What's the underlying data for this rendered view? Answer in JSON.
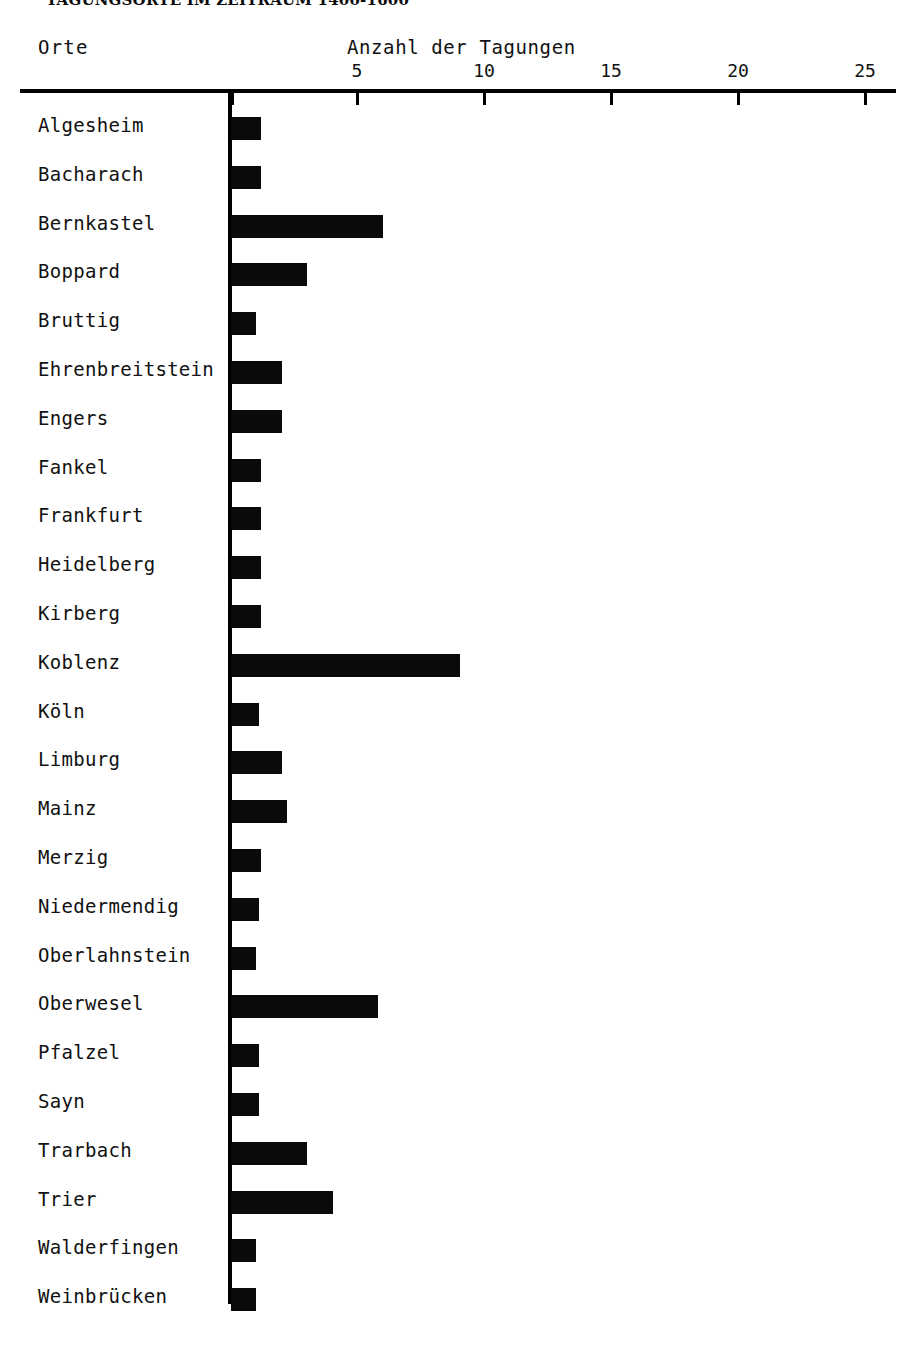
{
  "document": {
    "title_cropped": "TAGUNGSORTE IM ZEITRAUM 1400-1600"
  },
  "headers": {
    "category_axis_title": "Orte",
    "value_axis_title": "Anzahl der Tagungen"
  },
  "chart_data": {
    "type": "bar",
    "orientation": "horizontal",
    "title": "Anzahl der Tagungen",
    "xlabel": "Anzahl der Tagungen",
    "ylabel": "Orte",
    "xlim": [
      0,
      26
    ],
    "grid": false,
    "legend": null,
    "tick_labels": [
      "5",
      "10",
      "15",
      "20",
      "25"
    ],
    "tick_values": [
      5,
      10,
      15,
      20,
      25
    ],
    "categories": [
      "Algesheim",
      "Bacharach",
      "Bernkastel",
      "Boppard",
      "Bruttig",
      "Ehrenbreitstein",
      "Engers",
      "Fankel",
      "Frankfurt",
      "Heidelberg",
      "Kirberg",
      "Koblenz",
      "Köln",
      "Limburg",
      "Mainz",
      "Merzig",
      "Niedermendig",
      "Oberlahnstein",
      "Oberwesel",
      "Pfalzel",
      "Sayn",
      "Trarbach",
      "Trier",
      "Walderfingen",
      "Weinbrücken"
    ],
    "values": [
      1.2,
      1.2,
      6.0,
      3.0,
      1.0,
      2.0,
      2.0,
      1.2,
      1.2,
      1.2,
      1.2,
      9.0,
      1.1,
      2.0,
      2.2,
      1.2,
      1.1,
      1.0,
      5.8,
      1.1,
      1.1,
      3.0,
      4.0,
      1.0,
      1.0
    ]
  },
  "colors": {
    "bar": "#0a0a0a",
    "axis": "#000000",
    "text": "#111111",
    "background": "#ffffff"
  }
}
